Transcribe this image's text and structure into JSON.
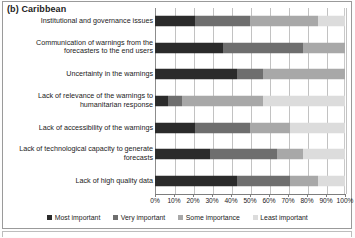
{
  "panel": {
    "title": "(b) Caribbean"
  },
  "chart_data": {
    "type": "bar",
    "orientation": "horizontal",
    "stacked": true,
    "normalized_percent": true,
    "title": "(b) Caribbean",
    "xlabel": "",
    "ylabel": "",
    "xlim": [
      0,
      100
    ],
    "grid": true,
    "legend_position": "bottom",
    "xticks": [
      "0%",
      "10%",
      "20%",
      "30%",
      "40%",
      "50%",
      "60%",
      "70%",
      "80%",
      "90%",
      "100%"
    ],
    "xtick_values": [
      0,
      10,
      20,
      30,
      40,
      50,
      60,
      70,
      80,
      90,
      100
    ],
    "categories": [
      "Institutional and governance issues",
      "Communication of warnings from the forecasters to the end users",
      "Uncertainty in the warnings",
      "Lack of relevance of the warnings to humanitarian response",
      "Lack of accessibility of the warnings",
      "Lack of technological capacity to generate forecasts",
      "Lack of high quality data"
    ],
    "series": [
      {
        "name": "Most important",
        "color": "#2b2b2b",
        "values": [
          21,
          36,
          43,
          7,
          21,
          29,
          43
        ]
      },
      {
        "name": "Very important",
        "color": "#6e6e6e",
        "values": [
          29,
          42,
          14,
          7,
          29,
          35,
          28
        ]
      },
      {
        "name": "Some importance",
        "color": "#a8a8a8",
        "values": [
          36,
          22,
          43,
          43,
          21,
          14,
          15
        ]
      },
      {
        "name": "Least important",
        "color": "#dcdcdc",
        "values": [
          14,
          0,
          0,
          43,
          29,
          22,
          14
        ]
      }
    ]
  },
  "legend": {
    "items": [
      {
        "label": "Most important",
        "color": "#2b2b2b"
      },
      {
        "label": "Very important",
        "color": "#6e6e6e"
      },
      {
        "label": "Some importance",
        "color": "#a8a8a8"
      },
      {
        "label": "Least important",
        "color": "#dcdcdc"
      }
    ]
  }
}
